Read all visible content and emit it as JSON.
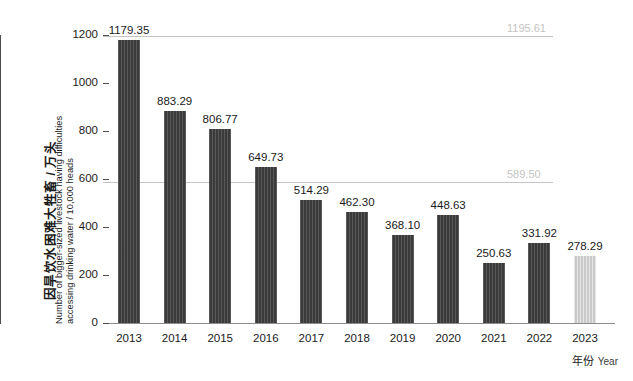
{
  "chart_data": {
    "type": "bar",
    "title": "",
    "ylabel_cn": "因旱饮水困难大牲畜 / 万头",
    "ylabel_en_line1": "Number of bigger-sized livestock having difficulties",
    "ylabel_en_line2": "accessing drinking water / 10,000 heads",
    "xlabel_cn": "年份",
    "xlabel_en": "Year",
    "categories": [
      "2013",
      "2014",
      "2015",
      "2016",
      "2017",
      "2018",
      "2019",
      "2020",
      "2021",
      "2022",
      "2023"
    ],
    "values": [
      1179.35,
      883.29,
      806.77,
      649.73,
      514.29,
      462.3,
      368.1,
      448.63,
      250.63,
      331.92,
      278.29
    ],
    "value_labels": [
      "1179.35",
      "883.29",
      "806.77",
      "649.73",
      "514.29",
      "462.30",
      "368.10",
      "448.63",
      "250.63",
      "331.92",
      "278.29"
    ],
    "ylim": [
      0,
      1200
    ],
    "yticks": [
      0,
      200,
      400,
      600,
      800,
      1000,
      1200
    ],
    "ytick_labels": [
      "0",
      "200",
      "400",
      "600",
      "800",
      "1000",
      "1200"
    ],
    "grid": false,
    "legend_position": "none",
    "highlight_index": 10,
    "bar_color": "#3a3a3a",
    "highlight_color": "#c9c9c9",
    "reference_lines": [
      {
        "value": 1195.61,
        "label": "1195.61",
        "color": "#c4c4c4"
      },
      {
        "value": 589.5,
        "label": "589.50",
        "color": "#c4c4c4"
      }
    ]
  }
}
